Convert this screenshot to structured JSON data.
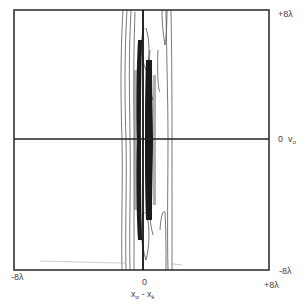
{
  "figure": {
    "type": "contour_plot",
    "frame": {
      "left": 14,
      "top": 10,
      "right": 269,
      "bottom": 270
    },
    "axes": {
      "center_x": 143,
      "center_y": 139
    },
    "colors": {
      "frame": "#333333",
      "contour": "#444444",
      "dense": "#111111",
      "background": "#ffffff"
    }
  },
  "labels": {
    "top_right": "+8λ",
    "right_zero": "0",
    "right_axis_var": "v",
    "right_axis_sub": "α",
    "bottom_left": "-8λ",
    "bottom_right_upper": "-8λ",
    "bottom_right_lower": "+8λ",
    "bottom_zero": "0",
    "xlabel_var1": "x",
    "xlabel_sub1": "α",
    "xlabel_minus": "-",
    "xlabel_var2": "x",
    "xlabel_sub2": "k"
  }
}
